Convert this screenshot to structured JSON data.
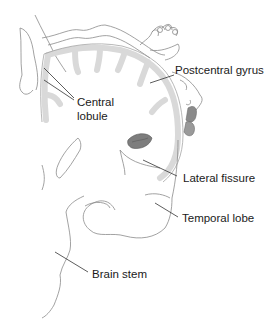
{
  "diagram": {
    "labels": [
      {
        "id": "postcentral-gyrus",
        "text": "Postcentral gyrus"
      },
      {
        "id": "central-lobule-line1",
        "text": "Central"
      },
      {
        "id": "central-lobule-line2",
        "text": "lobule"
      },
      {
        "id": "lateral-fissure",
        "text": "Lateral fissure"
      },
      {
        "id": "temporal-lobe",
        "text": "Temporal lobe"
      },
      {
        "id": "brain-stem",
        "text": "Brain stem"
      }
    ],
    "colors": {
      "outline": "#8a8a8a",
      "cortex_fill": "#d9d9d9",
      "dark_fill": "#7d7d7d",
      "leader_line": "#333333",
      "text": "#1a1a1a"
    }
  }
}
